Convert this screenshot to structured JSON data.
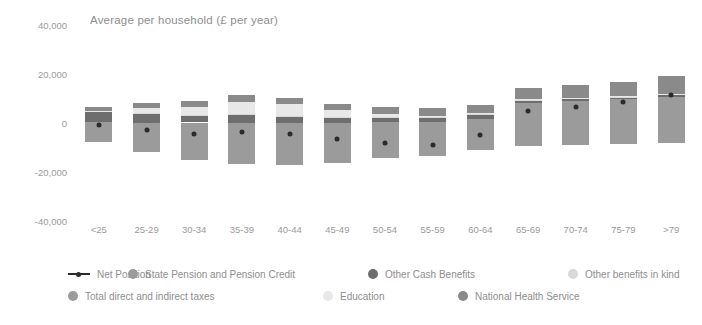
{
  "chart_data": {
    "type": "bar",
    "title": "Average per household (£ per year)",
    "xlabel": "",
    "ylabel": "",
    "ylim": [
      -40000,
      40000
    ],
    "yticks": [
      40000,
      20000,
      0,
      -20000,
      -40000
    ],
    "ytick_labels": [
      "40,000",
      "20,000",
      "0",
      "-20,000",
      "-40,000"
    ],
    "grid": false,
    "legend_position": "bottom",
    "stacked": true,
    "categories": [
      "<25",
      "25-29",
      "30-34",
      "35-39",
      "40-44",
      "45-49",
      "50-54",
      "55-59",
      "60-64",
      "65-69",
      "70-74",
      "75-79",
      ">79"
    ],
    "series": [
      {
        "name": "State Pension and Pension Credit",
        "color": "#9b9b9b",
        "values": [
          300,
          200,
          200,
          200,
          200,
          200,
          300,
          600,
          1800,
          8200,
          9000,
          9800,
          10800
        ]
      },
      {
        "name": "Other Cash Benefits",
        "color": "#6e6e6e",
        "values": [
          4200,
          3400,
          2600,
          3000,
          2400,
          2000,
          1600,
          1500,
          1500,
          900,
          700,
          600,
          600
        ]
      },
      {
        "name": "Other benefits in kind",
        "color": "#d9d9d9",
        "values": [
          400,
          400,
          400,
          400,
          400,
          400,
          400,
          400,
          400,
          400,
          400,
          400,
          400
        ]
      },
      {
        "name": "Education",
        "color": "#e8e8e8",
        "values": [
          200,
          2100,
          3300,
          5100,
          4700,
          2700,
          1500,
          400,
          200,
          100,
          100,
          100,
          100
        ]
      },
      {
        "name": "National Health Service",
        "color": "#8a8a8a",
        "values": [
          1500,
          1900,
          2400,
          2700,
          2700,
          2600,
          2800,
          3100,
          3600,
          4600,
          5200,
          6000,
          7400
        ]
      },
      {
        "name": "Total direct and indirect taxes",
        "color": "#9b9b9b",
        "values": [
          -7600,
          -11700,
          -15300,
          -16600,
          -17000,
          -16200,
          -14300,
          -13600,
          -11200,
          -9400,
          -9000,
          -8600,
          -8200
        ]
      }
    ],
    "net_position": {
      "name": "Net Position",
      "color": "#2b2b2b",
      "values": [
        -1000,
        -2900,
        -4600,
        -3700,
        -4500,
        -6700,
        -8200,
        -8800,
        -5100,
        5000,
        6700,
        8600,
        11500
      ]
    }
  },
  "legend": {
    "rows": [
      [
        {
          "label": "Net Position",
          "marker": "line",
          "color": "#2b2b2b"
        },
        {
          "label": "State Pension and Pension Credit",
          "marker": "dot",
          "color": "#9b9b9b"
        },
        {
          "label": "Other Cash Benefits",
          "marker": "dot",
          "color": "#6e6e6e"
        },
        {
          "label": "Other benefits in kind",
          "marker": "dot",
          "color": "#d9d9d9"
        }
      ],
      [
        {
          "label": "Total direct and indirect taxes",
          "marker": "dot",
          "color": "#9b9b9b"
        },
        {
          "label": "Education",
          "marker": "dot",
          "color": "#e8e8e8"
        },
        {
          "label": "National Health Service",
          "marker": "dot",
          "color": "#8a8a8a"
        }
      ]
    ]
  }
}
